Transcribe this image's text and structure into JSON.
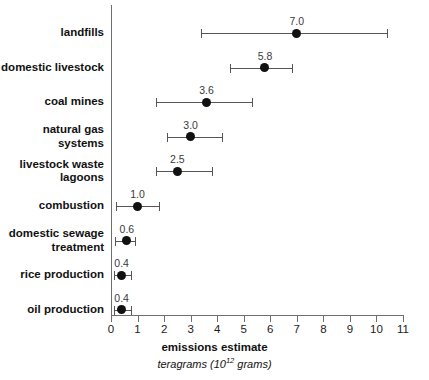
{
  "chart_data": {
    "type": "scatter",
    "title": "",
    "xlabel": "emissions estimate",
    "xlabel_sub_prefix": "teragrams (10",
    "xlabel_sub_exponent": "12",
    "xlabel_sub_suffix": " grams)",
    "ylabel": "",
    "xlim": [
      0,
      11
    ],
    "xticks": [
      0,
      1,
      2,
      3,
      4,
      5,
      6,
      7,
      8,
      9,
      10,
      11
    ],
    "xtick_labels": [
      "0",
      "1",
      "2",
      "3",
      "4",
      "5",
      "6",
      "7",
      "8",
      "9",
      "10",
      "11"
    ],
    "grid": false,
    "legend": "none",
    "marker_color": "#111111",
    "line_color": "#555555",
    "axis_color": "#6f6f6f",
    "categories": [
      "landfills",
      "domestic livestock",
      "coal mines",
      "natural gas\nsystems",
      "livestock waste\nlagoons",
      "combustion",
      "domestic sewage\ntreatment",
      "rice production",
      "oil production"
    ],
    "values": [
      7.0,
      5.8,
      3.6,
      3.0,
      2.5,
      1.0,
      0.6,
      0.4,
      0.4
    ],
    "value_labels": [
      "7.0",
      "5.8",
      "3.6",
      "3.0",
      "2.5",
      "1.0",
      "0.6",
      "0.4",
      "0.4"
    ],
    "low": [
      3.4,
      4.5,
      1.7,
      2.1,
      1.7,
      0.2,
      0.15,
      0.1,
      0.1
    ],
    "high": [
      10.4,
      6.8,
      5.3,
      4.2,
      3.8,
      1.8,
      0.9,
      0.75,
      0.75
    ],
    "points": [
      {
        "category": "landfills",
        "value": 7.0,
        "label": "7.0",
        "low": 3.4,
        "high": 10.4
      },
      {
        "category": "domestic livestock",
        "value": 5.8,
        "label": "5.8",
        "low": 4.5,
        "high": 6.8
      },
      {
        "category": "coal mines",
        "value": 3.6,
        "label": "3.6",
        "low": 1.7,
        "high": 5.3
      },
      {
        "category": "natural gas systems",
        "value": 3.0,
        "label": "3.0",
        "low": 2.1,
        "high": 4.2
      },
      {
        "category": "livestock waste lagoons",
        "value": 2.5,
        "label": "2.5",
        "low": 1.7,
        "high": 3.8
      },
      {
        "category": "combustion",
        "value": 1.0,
        "label": "1.0",
        "low": 0.2,
        "high": 1.8
      },
      {
        "category": "domestic sewage treatment",
        "value": 0.6,
        "label": "0.6",
        "low": 0.15,
        "high": 0.9
      },
      {
        "category": "rice production",
        "value": 0.4,
        "label": "0.4",
        "low": 0.1,
        "high": 0.75
      },
      {
        "category": "oil production",
        "value": 0.4,
        "label": "0.4",
        "low": 0.1,
        "high": 0.75
      }
    ]
  }
}
